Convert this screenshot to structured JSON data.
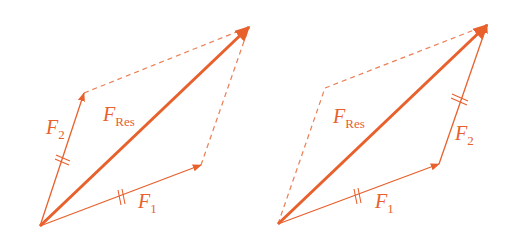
{
  "color": "#e8602c",
  "left_diagram": {
    "title": "Parallelogram rule",
    "resultant": {
      "symbol": "F",
      "subscript": "Res"
    },
    "force1": {
      "symbol": "F",
      "subscript": "1"
    },
    "force2": {
      "symbol": "F",
      "subscript": "2"
    }
  },
  "right_diagram": {
    "title": "Triangle (tip-to-tail) rule",
    "resultant": {
      "symbol": "F",
      "subscript": "Res"
    },
    "force1": {
      "symbol": "F",
      "subscript": "1"
    },
    "force2": {
      "symbol": "F",
      "subscript": "2"
    }
  }
}
